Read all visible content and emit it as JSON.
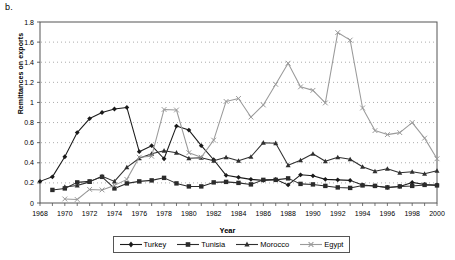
{
  "panel_label": "b.",
  "colors": {
    "turkey": "#1a1a1a",
    "tunisia": "#2b2b2b",
    "morocco": "#303030",
    "egypt": "#9a9a9a",
    "axis": "#555555",
    "grid": "#888888",
    "background": "#ffffff"
  },
  "axes": {
    "y_label": "Remittances on exports",
    "x_label": "Year",
    "y_ticks": [
      "0",
      "0.2",
      "0.4",
      "0.6",
      "0.8",
      "1",
      "1.2",
      "1.4",
      "1.6",
      "1.8"
    ],
    "x_ticks": [
      "1968",
      "1970",
      "1972",
      "1974",
      "1976",
      "1978",
      "1980",
      "1982",
      "1984",
      "1986",
      "1988",
      "1990",
      "1992",
      "1994",
      "1996",
      "1998",
      "2000"
    ]
  },
  "legend": {
    "position": "bottom",
    "items": [
      {
        "label": "Turkey",
        "marker": "diamond",
        "color": "#1a1a1a"
      },
      {
        "label": "Tunisia",
        "marker": "square",
        "color": "#2b2b2b"
      },
      {
        "label": "Morocco",
        "marker": "triangle",
        "color": "#303030"
      },
      {
        "label": "Egypt",
        "marker": "cross",
        "color": "#9a9a9a"
      }
    ]
  },
  "chart_data": {
    "type": "line",
    "title": "b.",
    "xlabel": "Year",
    "ylabel": "Remittances on exports",
    "xlim": [
      1968,
      2000
    ],
    "ylim": [
      0,
      1.8
    ],
    "ytick_step": 0.2,
    "xtick_step": 2,
    "grid": "horizontal-dotted",
    "legend_position": "bottom",
    "x": [
      1968,
      1969,
      1970,
      1971,
      1972,
      1973,
      1974,
      1975,
      1976,
      1977,
      1978,
      1979,
      1980,
      1981,
      1982,
      1983,
      1984,
      1985,
      1986,
      1987,
      1988,
      1989,
      1990,
      1991,
      1992,
      1993,
      1994,
      1995,
      1996,
      1997,
      1998,
      1999,
      2000
    ],
    "series": [
      {
        "name": "Turkey",
        "marker": "diamond",
        "color": "#1a1a1a",
        "values": [
          0.215,
          0.26,
          0.46,
          0.7,
          0.84,
          0.9,
          0.935,
          0.95,
          0.51,
          0.57,
          0.44,
          0.765,
          0.725,
          0.57,
          0.43,
          0.275,
          0.255,
          0.235,
          0.225,
          0.235,
          0.18,
          0.28,
          0.27,
          0.235,
          0.23,
          0.225,
          0.18,
          0.17,
          0.155,
          0.165,
          0.205,
          0.185,
          0.18
        ]
      },
      {
        "name": "Tunisia",
        "marker": "square",
        "color": "#2b2b2b",
        "values": [
          null,
          0.13,
          0.145,
          0.205,
          0.215,
          0.26,
          0.145,
          0.195,
          0.215,
          0.225,
          0.25,
          0.195,
          0.165,
          0.165,
          0.205,
          0.21,
          0.2,
          0.185,
          0.23,
          0.23,
          0.245,
          0.19,
          0.185,
          0.17,
          0.155,
          0.15,
          0.175,
          0.17,
          0.155,
          0.165,
          0.17,
          0.18,
          0.175
        ]
      },
      {
        "name": "Morocco",
        "marker": "triangle",
        "color": "#303030",
        "values": [
          null,
          null,
          0.16,
          0.175,
          0.21,
          0.265,
          0.215,
          0.355,
          0.445,
          0.49,
          0.52,
          0.5,
          0.445,
          0.45,
          0.42,
          0.455,
          0.42,
          0.46,
          0.6,
          0.595,
          0.375,
          0.425,
          0.49,
          0.415,
          0.455,
          0.435,
          0.36,
          0.315,
          0.34,
          0.3,
          0.31,
          0.29,
          0.32
        ]
      },
      {
        "name": "Egypt",
        "marker": "cross",
        "color": "#9a9a9a",
        "values": [
          null,
          null,
          0.04,
          0.035,
          0.135,
          0.13,
          0.175,
          0.235,
          0.455,
          0.465,
          0.93,
          0.925,
          0.5,
          0.455,
          0.625,
          1.01,
          1.04,
          0.855,
          0.975,
          1.18,
          1.39,
          1.155,
          1.12,
          0.995,
          1.695,
          1.62,
          0.945,
          0.72,
          0.68,
          0.7,
          0.8,
          0.645,
          0.44
        ]
      }
    ]
  }
}
